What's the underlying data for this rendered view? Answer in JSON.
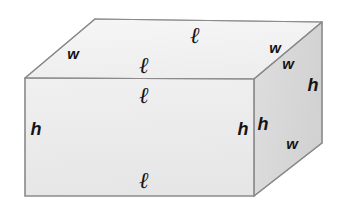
{
  "figure": {
    "name": "rectangular-prism",
    "canvas": {
      "width": 345,
      "height": 206
    },
    "background_color": "#ffffff",
    "outline_color": "#8a8a8a",
    "faces": {
      "top": {
        "name": "top-face",
        "fill_color": "#f2f2f2",
        "points": "95,19 322,22 254,79 25,78"
      },
      "front": {
        "name": "front-face",
        "fill_color": "#ececec",
        "points": "25,78 254,79 254,196 25,196"
      },
      "right": {
        "name": "right-face",
        "fill_color": "#d9d9d9",
        "points": "254,79 322,22 322,143 254,196"
      }
    },
    "edges": [
      {
        "name": "edge-top-back-left",
        "x1": 95,
        "y1": 19,
        "x2": 322,
        "y2": 22
      },
      {
        "name": "edge-top-back-right",
        "x1": 322,
        "y1": 22,
        "x2": 254,
        "y2": 79
      },
      {
        "name": "edge-top-front",
        "x1": 25,
        "y1": 78,
        "x2": 254,
        "y2": 79
      },
      {
        "name": "edge-top-left",
        "x1": 95,
        "y1": 19,
        "x2": 25,
        "y2": 78
      },
      {
        "name": "edge-front-left-vertical",
        "x1": 25,
        "y1": 78,
        "x2": 25,
        "y2": 196
      },
      {
        "name": "edge-front-right-vertical",
        "x1": 254,
        "y1": 79,
        "x2": 254,
        "y2": 196
      },
      {
        "name": "edge-front-bottom",
        "x1": 25,
        "y1": 196,
        "x2": 254,
        "y2": 196
      },
      {
        "name": "edge-right-back-vertical",
        "x1": 322,
        "y1": 22,
        "x2": 322,
        "y2": 143
      },
      {
        "name": "edge-right-bottom",
        "x1": 254,
        "y1": 196,
        "x2": 322,
        "y2": 143
      }
    ],
    "labels": [
      {
        "id": "l-top-face",
        "text": "ℓ",
        "style": "script",
        "size": "md",
        "x": 195,
        "y": 34
      },
      {
        "id": "l-top-front-above",
        "text": "ℓ",
        "style": "script",
        "size": "md",
        "x": 144,
        "y": 64
      },
      {
        "id": "l-front-top-below",
        "text": "ℓ",
        "style": "script",
        "size": "md",
        "x": 144,
        "y": 94
      },
      {
        "id": "l-front-bottom",
        "text": "ℓ",
        "style": "script",
        "size": "md",
        "x": 144,
        "y": 179
      },
      {
        "id": "w-top-left",
        "text": "w",
        "style": "sans",
        "size": "sm",
        "x": 73,
        "y": 53
      },
      {
        "id": "w-top-right-upper",
        "text": "w",
        "style": "sans",
        "size": "sm",
        "x": 275,
        "y": 47
      },
      {
        "id": "w-top-right-lower",
        "text": "w",
        "style": "sans",
        "size": "sm",
        "x": 288,
        "y": 63
      },
      {
        "id": "w-right-bottom",
        "text": "w",
        "style": "sans",
        "size": "sm",
        "x": 292,
        "y": 143
      },
      {
        "id": "h-front-left",
        "text": "h",
        "style": "sans",
        "size": "lg",
        "x": 36,
        "y": 129
      },
      {
        "id": "h-front-right",
        "text": "h",
        "style": "sans",
        "size": "lg",
        "x": 243,
        "y": 129
      },
      {
        "id": "h-right-left",
        "text": "h",
        "style": "sans",
        "size": "lg",
        "x": 263,
        "y": 124
      },
      {
        "id": "h-right-back",
        "text": "h",
        "style": "sans",
        "size": "lg",
        "x": 313,
        "y": 85
      }
    ]
  }
}
